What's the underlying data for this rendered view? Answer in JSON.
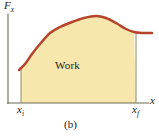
{
  "figure": {
    "caption": "(b)",
    "region_label": "Work",
    "axes": {
      "y_symbol": "F",
      "y_subscript": "x",
      "x_symbol": "x",
      "tick_initial_symbol": "x",
      "tick_initial_subscript": "i",
      "tick_final_symbol": "x",
      "tick_final_subscript": "f"
    },
    "colors": {
      "curve": "#b5442a",
      "fill": "#f7e7ac",
      "axis": "#6b6b57",
      "boundary": "#8a8a6a",
      "text": "#1a1a1a",
      "background": "#ffffff"
    }
  },
  "chart_data": {
    "type": "area",
    "title": "",
    "xlabel": "x",
    "ylabel": "F_x",
    "grid": false,
    "legend": null,
    "annotations": [
      "Work",
      "(b)"
    ],
    "x_tick_labels": [
      "x_i",
      "x_f"
    ],
    "x_tick_positions": [
      21,
      136
    ],
    "shaded_region": {
      "label": "Work",
      "x_start_px": 21,
      "x_end_px": 136,
      "baseline_y_px": 103,
      "fill": "#f7e7ac"
    },
    "curve_points_px": [
      [
        19,
        70
      ],
      [
        25,
        64
      ],
      [
        32,
        54
      ],
      [
        40,
        44
      ],
      [
        50,
        33
      ],
      [
        60,
        27
      ],
      [
        72,
        22
      ],
      [
        84,
        18
      ],
      [
        96,
        16
      ],
      [
        106,
        18
      ],
      [
        116,
        23
      ],
      [
        126,
        29
      ],
      [
        134,
        32
      ],
      [
        142,
        33
      ],
      [
        152,
        33
      ]
    ],
    "axis_ranges": {
      "x_axis_y_px": 103,
      "y_axis_x_px": 8,
      "y_axis_top_px": 14,
      "x_axis_end_px": 149
    }
  }
}
